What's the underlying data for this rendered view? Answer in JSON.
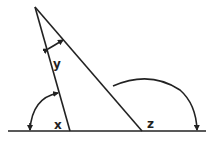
{
  "diagram": {
    "type": "geometry-angles",
    "colors": {
      "stroke": "#222222",
      "background": "#ffffff"
    },
    "points": {
      "apex": [
        35,
        7
      ],
      "left_foot": [
        70,
        131
      ],
      "right_foot": [
        142,
        131
      ],
      "baseline_start": [
        8,
        131
      ],
      "baseline_end": [
        206,
        131
      ]
    },
    "labels": {
      "x": "x",
      "y": "y",
      "z": "z"
    }
  }
}
